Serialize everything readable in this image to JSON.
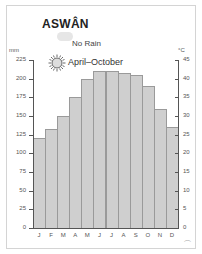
{
  "header": {
    "title": "ASWÂN",
    "rain_label": "No Rain",
    "sun_label": "April–October"
  },
  "axes": {
    "left_unit": "mm",
    "right_unit": "°C",
    "left_ticks": [
      "225",
      "200",
      "175",
      "150",
      "125",
      "100",
      "75",
      "50",
      "25",
      "0"
    ],
    "right_ticks": [
      "45",
      "40",
      "35",
      "30",
      "25",
      "20",
      "15",
      "10",
      "5",
      "0"
    ]
  },
  "colors": {
    "bar_fill": "#cfcfcf",
    "bar_stroke": "#9a9a9a",
    "axis": "#555555"
  },
  "chart_data": {
    "type": "bar",
    "title": "ASWÂN",
    "subtitle": "No Rain; sunshine April–October",
    "categories": [
      "J",
      "F",
      "M",
      "A",
      "M",
      "J",
      "J",
      "A",
      "S",
      "O",
      "N",
      "D"
    ],
    "series": [
      {
        "name": "Average max temperature (°C)",
        "values": [
          24,
          26.5,
          30,
          35,
          40,
          42,
          42,
          41.5,
          41,
          38,
          32,
          27
        ]
      },
      {
        "name": "Precipitation (mm)",
        "values": [
          0,
          0,
          0,
          0,
          0,
          0,
          0,
          0,
          0,
          0,
          0,
          0
        ]
      }
    ],
    "xlabel": "",
    "ylabel_left": "mm",
    "ylabel_right": "°C",
    "ylim_left": [
      0,
      225
    ],
    "ylim_right": [
      0,
      45
    ],
    "grid": false,
    "legend": [
      "No Rain",
      "April–October"
    ]
  }
}
